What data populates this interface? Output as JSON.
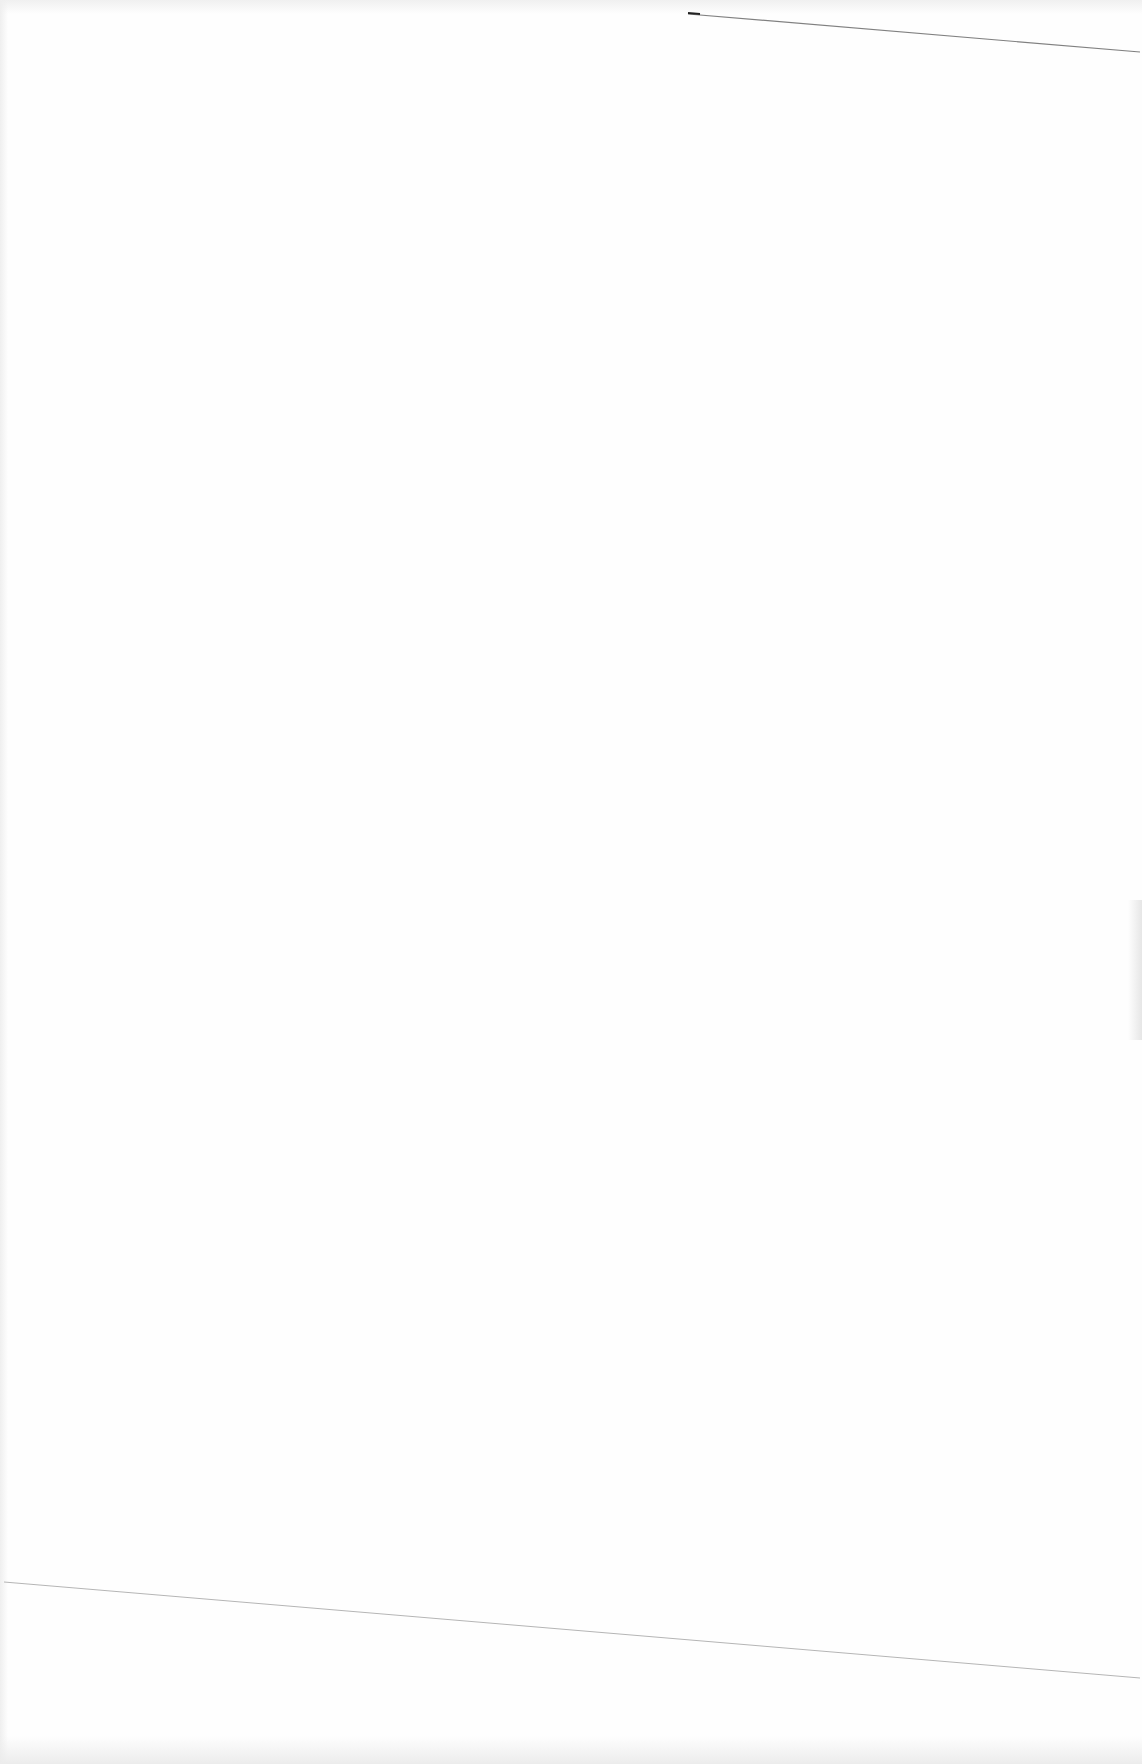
{
  "document": {
    "type": "blank scanned page",
    "text": "",
    "marks": [
      {
        "name": "top-scan-line",
        "from": [
          688,
          14
        ],
        "to": [
          1140,
          52
        ],
        "color": "#555555"
      },
      {
        "name": "bottom-scan-line",
        "from": [
          4,
          1582
        ],
        "to": [
          1140,
          1678
        ],
        "color": "#b5b5b5"
      }
    ]
  }
}
